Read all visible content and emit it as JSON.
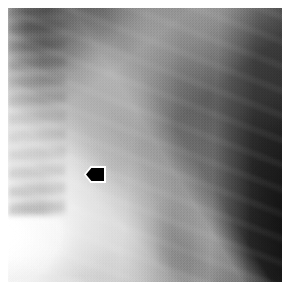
{
  "figure": {
    "kind": "medical-radiograph",
    "modality": "X-ray",
    "view": "lateral chest",
    "rendering": "grayscale",
    "width_px": 290,
    "height_px": 287,
    "border": {
      "color": "#ffffff",
      "inset_px": 8
    },
    "plate": {
      "left_px": 8,
      "top_px": 8,
      "width_px": 274,
      "height_px": 274,
      "background_hex": "#8d8d8d"
    },
    "caption": "",
    "label_text": ""
  },
  "tones": {
    "brightest_hex": "#ffffff",
    "bright_hex": "#f2f2f2",
    "midtone_hex": "#8e8e8e",
    "shadow_hex": "#3a3a3a",
    "darkest_hex": "#0a0a0a",
    "marker_hex": "#000000",
    "marker_outline_hex": "#ffffff"
  },
  "annotations": [
    {
      "id": "arrow-marker",
      "type": "arrow",
      "shape": "left-pointing-pentagon",
      "direction": "left",
      "fill_hex": "#000000",
      "outline_hex": "#ffffff",
      "left_px": 84,
      "top_px": 166,
      "width_px": 22,
      "height_px": 17,
      "points_at": "bright-dark tissue interface"
    }
  ],
  "anatomy_regions": [
    {
      "id": "lung-apex",
      "label": "Lung apex shadow",
      "position": "upper-left",
      "tone": "dark"
    },
    {
      "id": "humerus-edge",
      "label": "Humeral / scapular margin",
      "position": "upper-left",
      "tone": "bright"
    },
    {
      "id": "mediastinum",
      "label": "Mediastinal band",
      "position": "center",
      "tone": "bright"
    },
    {
      "id": "air-column",
      "label": "Tracheal air column",
      "position": "center-right",
      "tone": "bright"
    },
    {
      "id": "spine",
      "label": "Thoracic vertebral column",
      "position": "right",
      "tone": "mottled"
    },
    {
      "id": "tissue-interface",
      "label": "Soft tissue interface",
      "position": "center",
      "tone": "edge"
    },
    {
      "id": "posterior-lung",
      "label": "Posterior lung field",
      "position": "lower-right",
      "tone": "very-dark"
    },
    {
      "id": "diaphragm",
      "label": "Diaphragm / soft tissue",
      "position": "lower-left",
      "tone": "very-bright"
    },
    {
      "id": "rib-band-anterior",
      "label": "Anterior rib band",
      "position": "lower-left",
      "tone": "bright"
    },
    {
      "id": "rib-band-posterior",
      "label": "Posterior rib band",
      "position": "lower-center",
      "tone": "bright"
    }
  ]
}
